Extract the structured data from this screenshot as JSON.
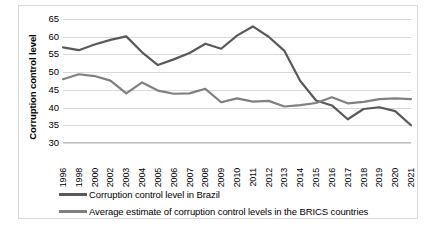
{
  "chart_data": {
    "type": "line",
    "title": "",
    "xlabel": "",
    "ylabel": "Corruption control level",
    "ylim": [
      30,
      65
    ],
    "yticks": [
      65,
      60,
      55,
      50,
      45,
      40,
      35,
      30
    ],
    "grid": true,
    "legend_position": "bottom",
    "categories": [
      "1996",
      "1998",
      "2000",
      "2002",
      "2003",
      "2004",
      "2005",
      "2006",
      "2007",
      "2008",
      "2009",
      "2010",
      "2011",
      "2012",
      "2013",
      "2014",
      "2015",
      "2016",
      "2017",
      "2018",
      "2019",
      "2020",
      "2021"
    ],
    "series": [
      {
        "name": "Corruption control level in Brazil",
        "color": "#595959",
        "values": [
          57.0,
          56.2,
          57.8,
          59.1,
          60.1,
          55.6,
          52.0,
          53.6,
          55.4,
          58.0,
          56.6,
          60.3,
          62.9,
          60.0,
          56.0,
          47.5,
          42.0,
          40.6,
          36.7,
          39.6,
          40.1,
          39.0,
          35.0
        ]
      },
      {
        "name": "Average estimate of corruption control levels in the BRICS countries",
        "color": "#808080",
        "values": [
          48.0,
          49.4,
          48.9,
          47.6,
          44.0,
          47.1,
          44.8,
          43.9,
          44.0,
          45.3,
          41.5,
          42.6,
          41.7,
          41.9,
          40.3,
          40.7,
          41.3,
          42.9,
          41.2,
          41.6,
          42.4,
          42.6,
          42.4
        ]
      }
    ]
  },
  "legend": {
    "items": [
      {
        "label": "Corruption control level in Brazil",
        "color": "#595959"
      },
      {
        "label": "Average estimate of corruption control levels in the BRICS countries",
        "color": "#808080"
      }
    ]
  }
}
